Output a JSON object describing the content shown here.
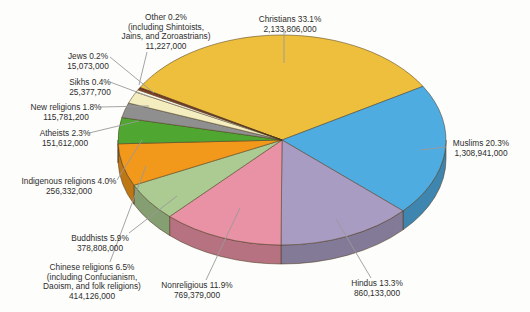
{
  "chart_data": {
    "type": "pie",
    "style": "3d-exploded-depth",
    "title": "",
    "legend": "none (callout labels with leader lines)",
    "start_angle_clockwise_from_top_deg": -60,
    "direction": "clockwise",
    "outline_color": "#4f3c20",
    "leader_line_color": "#9a9a9a",
    "label_text_color": "#2d2d2d",
    "background_color": "#fdfdfb",
    "slices": [
      {
        "name": "Christians",
        "percent": 33.1,
        "value": "2,133,806,000",
        "color": "#edbf3c",
        "label_lines": [
          "Christians 33.1%",
          "2,133,806,000"
        ]
      },
      {
        "name": "Muslims",
        "percent": 20.3,
        "value": "1,308,941,000",
        "color": "#4face1",
        "label_lines": [
          "Muslims 20.3%",
          "1,308,941,000"
        ]
      },
      {
        "name": "Hindus",
        "percent": 13.3,
        "value": "860,133,000",
        "color": "#a89cc3",
        "label_lines": [
          "Hindus 13.3%",
          "860,133,000"
        ]
      },
      {
        "name": "Nonreligious",
        "percent": 11.9,
        "value": "769,379,000",
        "color": "#e992a5",
        "label_lines": [
          "Nonreligious 11.9%",
          "769,379,000"
        ]
      },
      {
        "name": "Buddhists",
        "percent": 5.9,
        "value": "378,808,000",
        "color": "#abcb92",
        "label_lines": [
          "Buddhists 5.9%",
          "378,808,000"
        ]
      },
      {
        "name": "Chinese religions",
        "percent": 6.5,
        "value": "414,126,000",
        "color": "#f2981b",
        "label_lines": [
          "Chinese religions 6.5%",
          "(including Confucianism,",
          "Daoism, and folk religions)",
          "414,126,000"
        ]
      },
      {
        "name": "Indigenous religions",
        "percent": 4.0,
        "value": "256,332,000",
        "color": "#4fa630",
        "label_lines": [
          "Indigenous religions 4.0%",
          "256,332,000"
        ]
      },
      {
        "name": "Atheists",
        "percent": 2.3,
        "value": "151,612,000",
        "color": "#8f8f90",
        "label_lines": [
          "Atheists 2.3%",
          "151,612,000"
        ]
      },
      {
        "name": "New religions",
        "percent": 1.8,
        "value": "115,781,200",
        "color": "#f3edbf",
        "label_lines": [
          "New religions 1.8%",
          "115,781,200"
        ]
      },
      {
        "name": "Sikhs",
        "percent": 0.4,
        "value": "25,377,700",
        "color": "#faf6e6",
        "label_lines": [
          "Sikhs 0.4%",
          "25,377,700"
        ]
      },
      {
        "name": "Jews",
        "percent": 0.2,
        "value": "15,073,000",
        "color": "#a34226",
        "label_lines": [
          "Jews 0.2%",
          "15,073,000"
        ]
      },
      {
        "name": "Other",
        "percent": 0.2,
        "value": "11,227,000",
        "color": "#822f1b",
        "label_lines": [
          "Other 0.2%",
          "(including Shintoists,",
          "Jains, and Zoroastrians)",
          "11,227,000"
        ]
      }
    ]
  }
}
